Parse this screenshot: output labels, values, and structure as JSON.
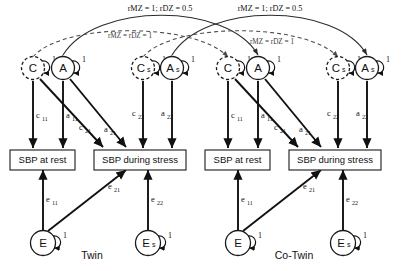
{
  "diagram": {
    "groups": [
      {
        "id": "twin",
        "label": "Twin"
      },
      {
        "id": "cotwin",
        "label": "Co-Twin"
      }
    ],
    "latent_variables": [
      {
        "id": "c1",
        "label": "C",
        "subscript": "",
        "style": "dashed",
        "loop_label": "1"
      },
      {
        "id": "a1",
        "label": "A",
        "subscript": "",
        "style": "solid",
        "loop_label": "1"
      },
      {
        "id": "cs1",
        "label": "C",
        "subscript": "s",
        "style": "dashed",
        "loop_label": "1"
      },
      {
        "id": "as1",
        "label": "A",
        "subscript": "s",
        "style": "solid",
        "loop_label": "1"
      },
      {
        "id": "e1",
        "label": "E",
        "subscript": "",
        "style": "solid",
        "loop_label": "1"
      },
      {
        "id": "es1",
        "label": "E",
        "subscript": "s",
        "style": "solid",
        "loop_label": "1"
      }
    ],
    "observed_variables": [
      {
        "id": "rest",
        "label": "SBP at rest"
      },
      {
        "id": "stress",
        "label": "SBP during stress"
      }
    ],
    "path_labels": {
      "c11": "c",
      "c11_sub": "11",
      "a11": "a",
      "a11_sub": "11",
      "c21": "c",
      "c21_sub": "21",
      "a21": "a",
      "a21_sub": "21",
      "c22": "c",
      "c22_sub": "22",
      "a22": "a",
      "a22_sub": "22",
      "e11": "e",
      "e11_sub": "11",
      "e21": "e",
      "e21_sub": "21",
      "e22": "e",
      "e22_sub": "22"
    },
    "correlations": [
      {
        "id": "additive",
        "label": "rMZ = 1; rDZ = 0.5",
        "style": "solid"
      },
      {
        "id": "shared",
        "label": "rMZ = rDZ = 1",
        "style": "dashed"
      },
      {
        "id": "additive_specific",
        "label": "rMZ = 1; rDZ = 0.5",
        "style": "solid"
      },
      {
        "id": "shared_specific",
        "label": "rMZ = rDZ = 1",
        "style": "dashed"
      }
    ],
    "loop_value": "1",
    "colors": {
      "line": "#111111",
      "dashed_line": "#4a4a4a",
      "background": "#ffffff",
      "text": "#111111"
    }
  }
}
